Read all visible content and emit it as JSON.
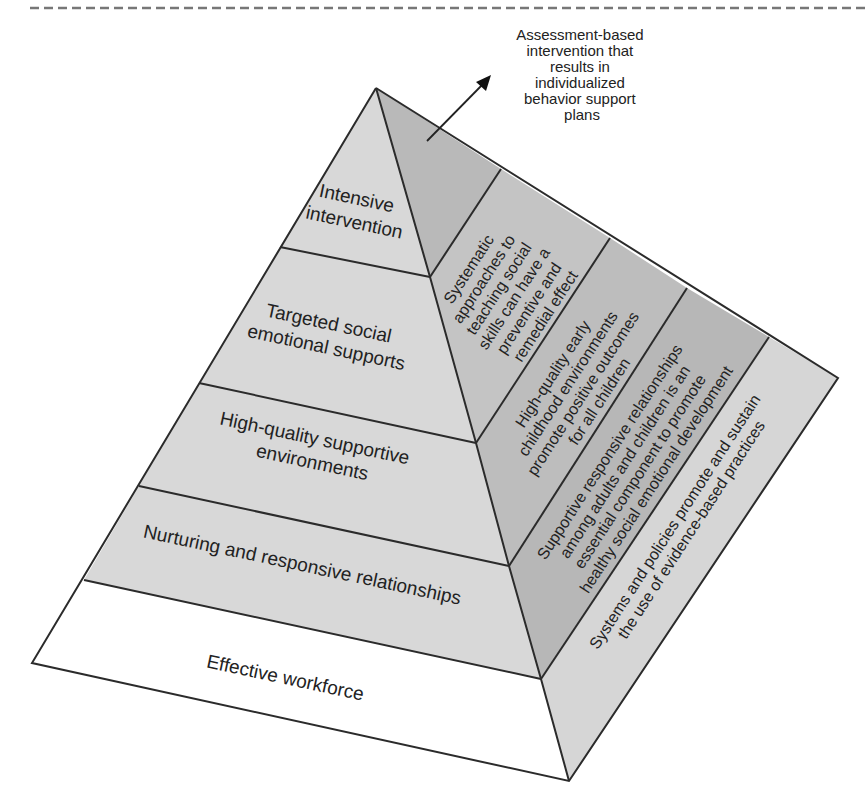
{
  "colors": {
    "background": "#ffffff",
    "left_face_tier": "#d8d8d8",
    "base_tier": "#ffffff",
    "right_face_dark": "#b9b9b9",
    "right_face_mid": "#c4c4c4",
    "right_face_outer": "#d6d6d6",
    "stroke": "#2b2b2b",
    "text": "#222222"
  },
  "callout": {
    "lines": [
      "Assessment-based",
      "intervention that",
      "results in",
      "individualized",
      "behavior support",
      "plans"
    ]
  },
  "left_face_tiers": [
    {
      "lines": [
        "Intensive",
        "intervention"
      ]
    },
    {
      "lines": [
        "Targeted social",
        "emotional supports"
      ]
    },
    {
      "lines": [
        "High-quality supportive",
        "environments"
      ]
    },
    {
      "lines": [
        "Nurturing and responsive relationships"
      ]
    },
    {
      "lines": [
        "Effective workforce"
      ]
    }
  ],
  "right_face_bands": [
    {
      "lines": [
        "Systematic",
        "approaches to",
        "teaching social",
        "skills can have a",
        "preventive and",
        "remedial effect"
      ]
    },
    {
      "lines": [
        "High-quality early",
        "childhood environments",
        "promote positive outcomes",
        "for all children"
      ]
    },
    {
      "lines": [
        "Supportive responsive relationships",
        "among adults and children is an",
        "essential component to promote",
        "healthy social emotional development"
      ]
    },
    {
      "lines": [
        "Systems and policies promote and sustain",
        "the use of evidence-based practices"
      ]
    }
  ]
}
